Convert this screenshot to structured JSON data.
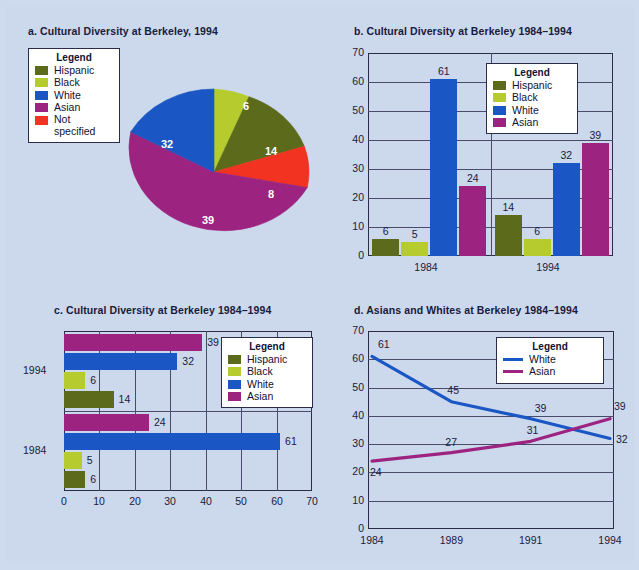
{
  "colors": {
    "hispanic": "#5c6b1b",
    "black": "#b6cc2e",
    "white": "#1a56c4",
    "asian": "#9c2480",
    "not_specified": "#f23322",
    "background": "#ccd8ec",
    "axis": "#2b2b4a",
    "text": "#1a1a3c"
  },
  "legend_title": "Legend",
  "charts": {
    "a": {
      "title": "a.  Cultural Diversity at Berkeley, 1994",
      "legend": {
        "title": "Legend",
        "items": [
          {
            "label": "Hispanic",
            "color": "#5c6b1b"
          },
          {
            "label": "Black",
            "color": "#b6cc2e"
          },
          {
            "label": "White",
            "color": "#1a56c4"
          },
          {
            "label": "Asian",
            "color": "#9c2480"
          },
          {
            "label": "Not specified",
            "color": "#f23322"
          }
        ]
      },
      "chart_data": {
        "type": "pie",
        "title": "a.  Cultural Diversity at Berkeley, 1994",
        "categories": [
          "Black",
          "Hispanic",
          "Not specified",
          "Asian",
          "White"
        ],
        "values": [
          6,
          14,
          8,
          39,
          32
        ],
        "colors": [
          "#b6cc2e",
          "#5c6b1b",
          "#f23322",
          "#9c2480",
          "#1a56c4"
        ],
        "labels": [
          "6",
          "14",
          "8",
          "39",
          "32"
        ],
        "xlabel": "",
        "ylabel": "",
        "legend_position": "top-left"
      }
    },
    "b": {
      "title": "b.  Cultural Diversity at Berkeley 1984–1994",
      "legend": {
        "title": "Legend",
        "items": [
          {
            "label": "Hispanic",
            "color": "#5c6b1b"
          },
          {
            "label": "Black",
            "color": "#b6cc2e"
          },
          {
            "label": "White",
            "color": "#1a56c4"
          },
          {
            "label": "Asian",
            "color": "#9c2480"
          }
        ]
      },
      "chart_data": {
        "type": "bar",
        "title": "b.  Cultural Diversity at Berkeley 1984–1994",
        "orientation": "vertical",
        "categories": [
          "1984",
          "1994"
        ],
        "series": [
          {
            "name": "Hispanic",
            "color": "#5c6b1b",
            "values": [
              6,
              14
            ]
          },
          {
            "name": "Black",
            "color": "#b6cc2e",
            "values": [
              5,
              6
            ]
          },
          {
            "name": "White",
            "color": "#1a56c4",
            "values": [
              61,
              32
            ]
          },
          {
            "name": "Asian",
            "color": "#9c2480",
            "values": [
              24,
              39
            ]
          }
        ],
        "yticks": [
          0,
          10,
          20,
          30,
          40,
          50,
          60,
          70
        ],
        "ylim": [
          0,
          70
        ],
        "xlabel": "",
        "ylabel": "",
        "grid": true,
        "legend_position": "upper-center"
      }
    },
    "c": {
      "title": "c.  Cultural Diversity at Berkeley 1984–1994",
      "legend": {
        "title": "Legend",
        "items": [
          {
            "label": "Hispanic",
            "color": "#5c6b1b"
          },
          {
            "label": "Black",
            "color": "#b6cc2e"
          },
          {
            "label": "White",
            "color": "#1a56c4"
          },
          {
            "label": "Asian",
            "color": "#9c2480"
          }
        ]
      },
      "chart_data": {
        "type": "bar",
        "title": "c.  Cultural Diversity at Berkeley 1984–1994",
        "orientation": "horizontal",
        "categories": [
          "1984",
          "1994"
        ],
        "series": [
          {
            "name": "Hispanic",
            "color": "#5c6b1b",
            "values": [
              6,
              14
            ]
          },
          {
            "name": "Black",
            "color": "#b6cc2e",
            "values": [
              5,
              6
            ]
          },
          {
            "name": "White",
            "color": "#1a56c4",
            "values": [
              61,
              32
            ]
          },
          {
            "name": "Asian",
            "color": "#9c2480",
            "values": [
              24,
              39
            ]
          }
        ],
        "xticks": [
          0,
          10,
          20,
          30,
          40,
          50,
          60,
          70
        ],
        "xlim": [
          0,
          70
        ],
        "xlabel": "",
        "ylabel": "",
        "grid": true,
        "legend_position": "upper-right"
      }
    },
    "d": {
      "title": "d.  Asians and Whites at Berkeley 1984–1994",
      "legend": {
        "title": "Legend",
        "items": [
          {
            "label": "White",
            "color": "#1a56c4"
          },
          {
            "label": "Asian",
            "color": "#9c2480"
          }
        ]
      },
      "chart_data": {
        "type": "line",
        "title": "d.  Asians and Whites at Berkeley 1984–1994",
        "x": [
          "1984",
          "1989",
          "1991",
          "1994"
        ],
        "series": [
          {
            "name": "White",
            "color": "#1a56c4",
            "values": [
              61,
              45,
              39,
              32
            ],
            "labels": [
              "61",
              "45",
              "39",
              "32"
            ]
          },
          {
            "name": "Asian",
            "color": "#9c2480",
            "values": [
              24,
              27,
              31,
              39
            ],
            "labels": [
              "24",
              "27",
              "31",
              "39"
            ]
          }
        ],
        "yticks": [
          0,
          10,
          20,
          30,
          40,
          50,
          60,
          70
        ],
        "ylim": [
          0,
          70
        ],
        "xlabel": "",
        "ylabel": "",
        "grid": true,
        "legend_position": "upper-right"
      }
    }
  }
}
